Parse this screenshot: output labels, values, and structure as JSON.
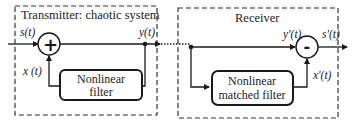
{
  "diagram": {
    "transmitter": {
      "title": "Transmitter: chaotic system",
      "filter_line1": "Nonlinear",
      "filter_line2": "filter",
      "sum_symbol": "+",
      "input_label": "s(t)",
      "output_label": "y(t)",
      "feedback_label": "x (t)"
    },
    "receiver": {
      "title": "Receiver",
      "filter_line1": "Nonlinear",
      "filter_line2": "matched filter",
      "diff_symbol": "-",
      "input_label": "y'(t)",
      "output_label": "s'(t)",
      "feedback_label": "x'(t)"
    },
    "colors": {
      "line": "#1a1a1a",
      "background": "#ffffff"
    }
  }
}
